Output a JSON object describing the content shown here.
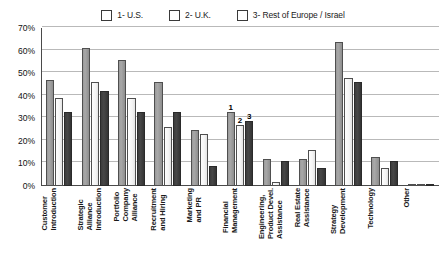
{
  "chart_data": {
    "type": "bar",
    "title": "",
    "xlabel": "",
    "ylabel": "",
    "ylim": [
      0,
      70
    ],
    "ytick_step": 10,
    "grid": true,
    "legend_position": "top-center",
    "yticks": [
      "70%",
      "60%",
      "50%",
      "40%",
      "30%",
      "20%",
      "10%",
      "0%"
    ],
    "categories": [
      "Customer\nIntroduction",
      "Strategic\nAlliance\nIntroduction",
      "Portfolio\nCompany\nAlliance",
      "Recruitment\nand Hiring",
      "Marketing\nand PR",
      "Financial\nManagement",
      "Engineering,\nProduct Devel.\nAssistance",
      "Real Estate\nAssistance",
      "Strategy\nDevelopment",
      "Technology",
      "Other"
    ],
    "series": [
      {
        "name": "1- U.S.",
        "key": "s1",
        "color": "#9a9a9a",
        "values": [
          47,
          61,
          56,
          46,
          25,
          33,
          12,
          12,
          64,
          13,
          1
        ]
      },
      {
        "name": "2- U.K.",
        "key": "s2",
        "color": "#fafafa",
        "values": [
          39,
          46,
          39,
          26,
          23,
          27,
          2,
          16,
          48,
          8,
          1
        ]
      },
      {
        "name": "3- Rest of Europe / Israel",
        "key": "s3",
        "color": "#3c3c3c",
        "values": [
          33,
          42,
          33,
          33,
          9,
          29,
          11,
          8,
          46,
          11,
          1
        ]
      }
    ],
    "annotations": [
      {
        "category_index": 5,
        "series_index": 0,
        "text": "1"
      },
      {
        "category_index": 5,
        "series_index": 1,
        "text": "2"
      },
      {
        "category_index": 5,
        "series_index": 2,
        "text": "3"
      }
    ]
  },
  "legend": {
    "entries": [
      {
        "label": "1- U.S."
      },
      {
        "label": "2- U.K."
      },
      {
        "label": "3- Rest of Europe / Israel"
      }
    ]
  }
}
